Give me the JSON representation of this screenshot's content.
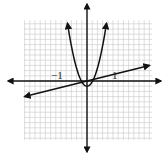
{
  "chart_data": {
    "type": "line",
    "title": "",
    "xlabel": "",
    "ylabel": "",
    "grid": true,
    "xlim": [
      -2.4,
      2.5
    ],
    "ylim": [
      -2.3,
      2.35
    ],
    "tick_labels": [
      {
        "text": "−1",
        "x": -1
      },
      {
        "text": "1",
        "x": 1
      }
    ],
    "series": [
      {
        "name": "parabola",
        "kind": "quadratic",
        "equation_estimate": "y = 4.3x^2 - 0.2",
        "vertex": [
          0,
          -0.2
        ],
        "points": [
          [
            -0.75,
            2.2
          ],
          [
            -0.5,
            0.88
          ],
          [
            -0.3,
            0.19
          ],
          [
            0,
            -0.2
          ],
          [
            0.3,
            0.19
          ],
          [
            0.5,
            0.88
          ],
          [
            0.75,
            2.2
          ]
        ],
        "arrows": "both-ends"
      },
      {
        "name": "line",
        "kind": "linear",
        "equation_estimate": "y = 0.24x + 0.05",
        "slope": 0.24,
        "intercept": 0.05,
        "points": [
          [
            -2.4,
            -0.6
          ],
          [
            2.4,
            0.6
          ]
        ],
        "arrows": "both-ends"
      }
    ]
  },
  "labels": {
    "neg_one": "−1",
    "pos_one": "1"
  }
}
